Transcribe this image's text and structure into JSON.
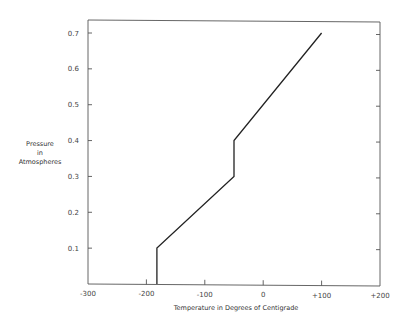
{
  "chart_data": {
    "type": "line",
    "title": "",
    "xlabel": "Temperature in Degrees of Centigrade",
    "ylabel": [
      "Pressure",
      "in",
      "Atmospheres"
    ],
    "xlim": [
      -300,
      200
    ],
    "ylim": [
      0,
      0.735
    ],
    "x_ticks": [
      "-300",
      "-200",
      "-100",
      "0",
      "+100",
      "+200"
    ],
    "x_tick_values": [
      -300,
      -200,
      -100,
      0,
      100,
      200
    ],
    "y_ticks": [
      "0.1",
      "0.2",
      "0.3",
      "0.4",
      "0.5",
      "0.6",
      "0.7"
    ],
    "y_tick_values": [
      0.1,
      0.2,
      0.3,
      0.4,
      0.5,
      0.6,
      0.7
    ],
    "grid": false,
    "legend": null,
    "series": [
      {
        "name": "pressure-temperature curve",
        "x": [
          -182,
          -182,
          -50,
          -50,
          100
        ],
        "y": [
          0,
          0.1,
          0.3,
          0.4,
          0.7
        ]
      }
    ]
  }
}
